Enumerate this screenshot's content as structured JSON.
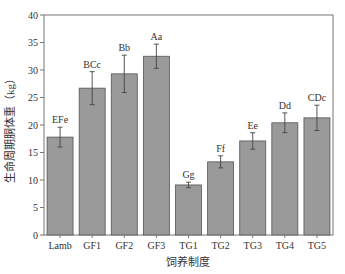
{
  "chart_data": {
    "type": "bar",
    "title": "",
    "xlabel": "饲养制度",
    "ylabel": "生命周期胴体重（kg）",
    "ylim": [
      0,
      40
    ],
    "yticks": [
      0,
      5,
      10,
      15,
      20,
      25,
      30,
      35,
      40
    ],
    "grid": false,
    "legend": null,
    "categories": [
      "Lamb",
      "GF1",
      "GF2",
      "GF3",
      "TG1",
      "TG2",
      "TG3",
      "TG4",
      "TG5"
    ],
    "values": [
      17.8,
      26.7,
      29.3,
      32.5,
      9.1,
      13.3,
      17.1,
      20.4,
      21.3
    ],
    "error_bars": [
      1.8,
      3.0,
      3.4,
      2.2,
      0.5,
      1.1,
      1.5,
      1.8,
      2.3
    ],
    "significance_labels": [
      "EFe",
      "BCc",
      "Bb",
      "Aa",
      "Gg",
      "Ff",
      "Ee",
      "Dd",
      "CDc"
    ],
    "bar_color": "#9a9a9a",
    "bar_edge_color": "#555555"
  }
}
